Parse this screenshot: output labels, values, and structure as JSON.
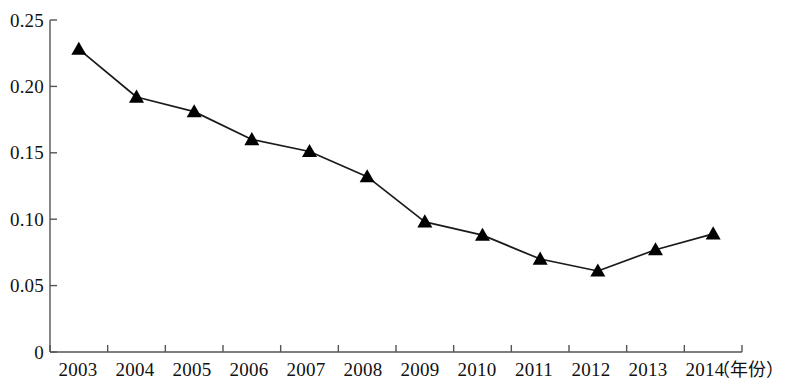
{
  "chart_data": {
    "type": "line",
    "title": "",
    "subtitle": "",
    "xlabel": "（年份）",
    "ylabel": "",
    "categories": [
      "2003",
      "2004",
      "2005",
      "2006",
      "2007",
      "2008",
      "2009",
      "2010",
      "2011",
      "2012",
      "2013",
      "2014"
    ],
    "values": [
      0.228,
      0.192,
      0.181,
      0.16,
      0.151,
      0.132,
      0.098,
      0.088,
      0.07,
      0.061,
      0.077,
      0.089
    ],
    "series": [
      {
        "name": "",
        "values": [
          0.228,
          0.192,
          0.181,
          0.16,
          0.151,
          0.132,
          0.098,
          0.088,
          0.07,
          0.061,
          0.077,
          0.089
        ]
      }
    ],
    "ylim": [
      0,
      0.25
    ],
    "ytick_labels": [
      "0.25",
      "0.20",
      "0.15",
      "0.10",
      "0.05",
      "0"
    ],
    "ytick_values": [
      0.25,
      0.2,
      0.15,
      0.1,
      0.05,
      0
    ],
    "grid": false,
    "legend": null,
    "legend_position": "none",
    "marker": "triangle",
    "line_color": "#1a1a1a",
    "marker_color": "#000000",
    "axis_color": "#555555",
    "background_color": "#ffffff"
  },
  "axis": {
    "x_unit_note": "（年份）"
  }
}
